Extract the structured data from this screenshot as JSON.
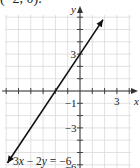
{
  "caption_partial": "(−2, 0).",
  "chart_data": {
    "type": "line",
    "title": "",
    "xlabel": "x",
    "ylabel": "y",
    "equation_label": "3x − 2y = −6",
    "equation": "y = 1.5x + 3",
    "series": [
      {
        "name": "3x − 2y = −6",
        "x": [
          -5.9,
          -2,
          0,
          1.87
        ],
        "y": [
          -5.85,
          0,
          3,
          5.8
        ]
      }
    ],
    "points_highlighted": [
      {
        "label": "y-intercept",
        "x": 0,
        "y": 3
      },
      {
        "label": "x-intercept",
        "x": -2,
        "y": 0
      }
    ],
    "x_tick_labels": [
      {
        "value": 3,
        "label": "3"
      }
    ],
    "y_tick_labels": [
      {
        "value": 3,
        "label": "3"
      },
      {
        "value": -1,
        "label": "−1"
      },
      {
        "value": -3,
        "label": "−3"
      },
      {
        "value": -6,
        "label": "−6"
      }
    ],
    "xlim": [
      -6,
      4.5
    ],
    "ylim": [
      -6,
      6
    ],
    "grid": true,
    "grid_step": 1,
    "arrows_on_axes": true,
    "arrows_on_line": true
  },
  "style": {
    "grid_color": "#d9d9d9",
    "axis_color": "#333333",
    "line_color": "#111111",
    "text_color": "#222222"
  }
}
